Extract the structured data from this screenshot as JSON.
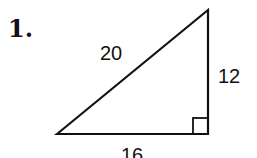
{
  "problem": {
    "number": "1.",
    "shape": "right-triangle",
    "hypotenuse_label": "20",
    "vertical_leg_label": "12",
    "horizontal_leg_label": "16",
    "right_angle_marker": "bottom-right"
  }
}
